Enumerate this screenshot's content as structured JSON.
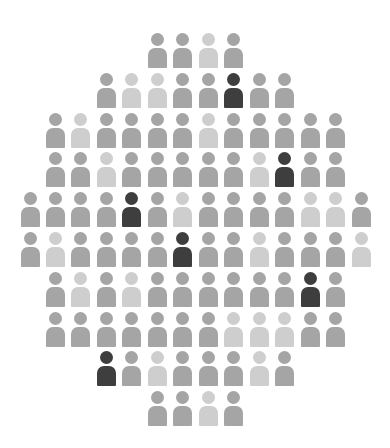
{
  "chart_data": {
    "type": "pictogram",
    "title": "",
    "icon": "person-icon",
    "colors": {
      "medium": "#a5a5a5",
      "light": "#cecece",
      "dark": "#3e3e3e"
    },
    "layout": {
      "pitch_x": 25.46,
      "pitch_y": 39.8,
      "center_x": 195.5,
      "first_row_top": 33
    },
    "rows": [
      [
        "m",
        "m",
        "l",
        "m"
      ],
      [
        "m",
        "l",
        "l",
        "m",
        "m",
        "d",
        "m",
        "m"
      ],
      [
        "m",
        "l",
        "m",
        "m",
        "m",
        "m",
        "l",
        "m",
        "m",
        "m",
        "m",
        "m"
      ],
      [
        "m",
        "m",
        "l",
        "m",
        "m",
        "m",
        "m",
        "m",
        "l",
        "d",
        "m",
        "m"
      ],
      [
        "m",
        "m",
        "m",
        "m",
        "d",
        "m",
        "l",
        "m",
        "m",
        "m",
        "m",
        "l",
        "l",
        "m"
      ],
      [
        "m",
        "l",
        "m",
        "m",
        "m",
        "m",
        "d",
        "m",
        "m",
        "l",
        "m",
        "m",
        "m",
        "l"
      ],
      [
        "m",
        "l",
        "m",
        "l",
        "m",
        "m",
        "m",
        "m",
        "m",
        "m",
        "d",
        "m"
      ],
      [
        "m",
        "m",
        "m",
        "m",
        "m",
        "m",
        "m",
        "l",
        "l",
        "l",
        "m",
        "m"
      ],
      [
        "d",
        "m",
        "l",
        "m",
        "m",
        "m",
        "l",
        "m"
      ],
      [
        "m",
        "m",
        "l",
        "m"
      ]
    ],
    "counts": {
      "total": 100,
      "dark": 7,
      "light": 22,
      "medium": 71
    }
  }
}
